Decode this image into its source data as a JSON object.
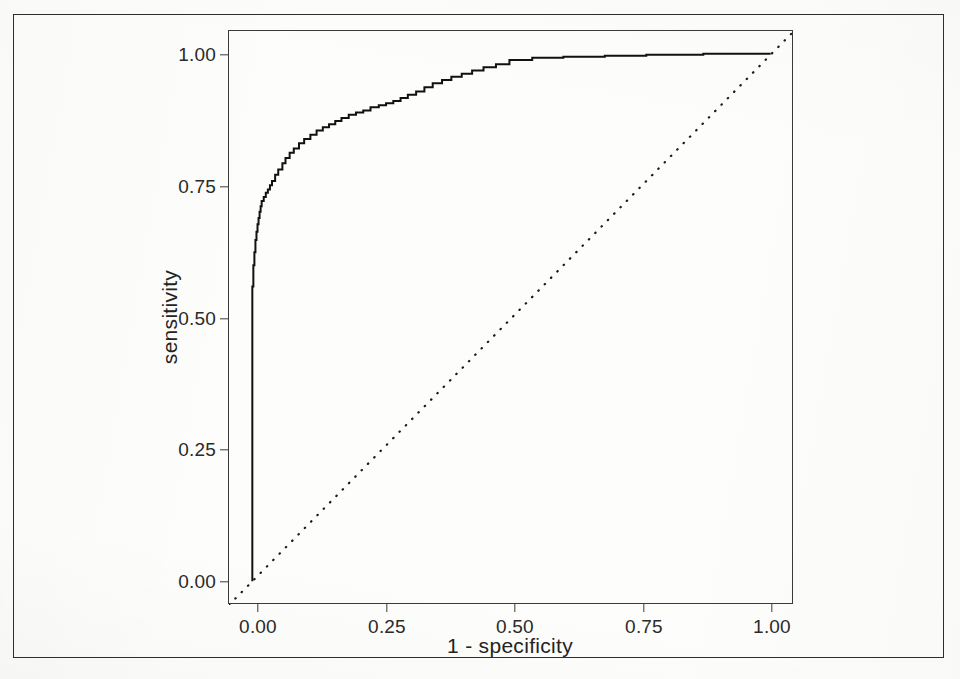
{
  "figure": {
    "frame_color": "#2e2e2e",
    "panel_border_color": "#3a3a3a",
    "background_color": "#fdfdfc"
  },
  "axes": {
    "x_title": "1 - specificity",
    "y_title": "sensitivity",
    "x_ticks": [
      "0.00",
      "0.25",
      "0.50",
      "0.75",
      "1.00"
    ],
    "y_ticks": [
      "0.00",
      "0.25",
      "0.50",
      "0.75",
      "1.00"
    ],
    "x_tick_values": [
      0.0,
      0.25,
      0.5,
      0.75,
      1.0
    ],
    "y_tick_values": [
      0.0,
      0.25,
      0.5,
      0.75,
      1.0
    ]
  },
  "chart_data": {
    "type": "line",
    "title": "",
    "subtitle": "",
    "xlabel": "1 - specificity",
    "ylabel": "sensitivity",
    "xlim": [
      -0.045,
      1.045
    ],
    "ylim": [
      -0.045,
      1.045
    ],
    "grid": false,
    "legend": null,
    "legend_position": "none",
    "annotations": [],
    "series": [
      {
        "name": "ROC curve",
        "type": "step",
        "style": "solid",
        "color": "#111111",
        "linewidth": 2.0,
        "x": [
          0.0,
          0.0,
          0.0,
          0.0,
          0.0,
          0.0,
          0.0,
          0.0,
          0.0,
          0.002,
          0.002,
          0.004,
          0.004,
          0.006,
          0.006,
          0.008,
          0.008,
          0.01,
          0.01,
          0.012,
          0.012,
          0.014,
          0.014,
          0.016,
          0.016,
          0.018,
          0.018,
          0.022,
          0.022,
          0.026,
          0.026,
          0.03,
          0.03,
          0.034,
          0.034,
          0.038,
          0.038,
          0.044,
          0.044,
          0.05,
          0.05,
          0.058,
          0.058,
          0.064,
          0.064,
          0.072,
          0.072,
          0.08,
          0.08,
          0.09,
          0.09,
          0.1,
          0.1,
          0.112,
          0.112,
          0.124,
          0.124,
          0.136,
          0.136,
          0.148,
          0.148,
          0.16,
          0.16,
          0.172,
          0.172,
          0.186,
          0.186,
          0.2,
          0.2,
          0.214,
          0.214,
          0.228,
          0.228,
          0.244,
          0.244,
          0.258,
          0.258,
          0.272,
          0.272,
          0.286,
          0.286,
          0.3,
          0.3,
          0.316,
          0.316,
          0.332,
          0.332,
          0.348,
          0.348,
          0.366,
          0.366,
          0.384,
          0.384,
          0.404,
          0.404,
          0.424,
          0.424,
          0.446,
          0.446,
          0.47,
          0.47,
          0.496,
          0.496,
          0.54,
          0.54,
          0.6,
          0.6,
          0.68,
          0.68,
          0.76,
          0.76,
          0.87,
          0.87,
          1.0
        ],
        "y": [
          0.0,
          0.06,
          0.14,
          0.22,
          0.29,
          0.36,
          0.43,
          0.5,
          0.56,
          0.56,
          0.6,
          0.6,
          0.625,
          0.625,
          0.648,
          0.648,
          0.664,
          0.664,
          0.678,
          0.678,
          0.69,
          0.69,
          0.702,
          0.702,
          0.712,
          0.712,
          0.722,
          0.722,
          0.73,
          0.73,
          0.738,
          0.738,
          0.744,
          0.744,
          0.752,
          0.752,
          0.76,
          0.76,
          0.772,
          0.772,
          0.782,
          0.782,
          0.794,
          0.794,
          0.804,
          0.804,
          0.814,
          0.814,
          0.822,
          0.822,
          0.832,
          0.832,
          0.84,
          0.84,
          0.848,
          0.848,
          0.856,
          0.856,
          0.862,
          0.862,
          0.868,
          0.868,
          0.874,
          0.874,
          0.88,
          0.88,
          0.886,
          0.886,
          0.89,
          0.89,
          0.894,
          0.894,
          0.9,
          0.9,
          0.904,
          0.904,
          0.908,
          0.908,
          0.912,
          0.912,
          0.918,
          0.918,
          0.924,
          0.924,
          0.93,
          0.93,
          0.938,
          0.938,
          0.946,
          0.946,
          0.952,
          0.952,
          0.958,
          0.958,
          0.964,
          0.964,
          0.97,
          0.97,
          0.976,
          0.976,
          0.982,
          0.982,
          0.99,
          0.99,
          0.994,
          0.994,
          0.996,
          0.996,
          0.998,
          0.998,
          1.0,
          1.0,
          1.002,
          1.002
        ]
      },
      {
        "name": "chance diagonal",
        "type": "line",
        "style": "dotted",
        "color": "#1a1a1a",
        "linewidth": 2.2,
        "x": [
          -0.045,
          1.045
        ],
        "y": [
          -0.045,
          1.045
        ]
      }
    ]
  }
}
